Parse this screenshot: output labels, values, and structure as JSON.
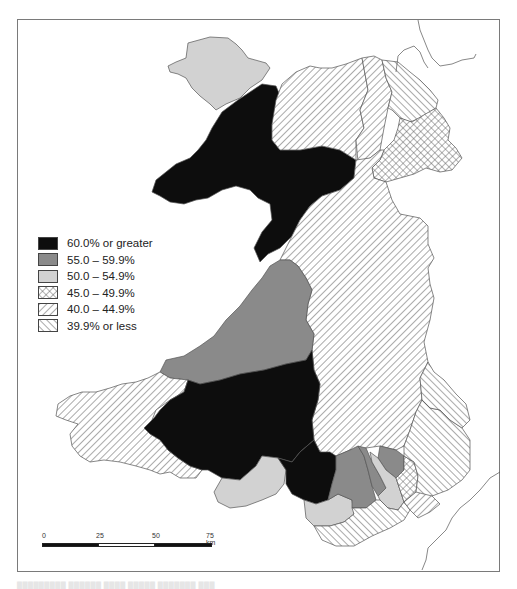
{
  "map": {
    "title": "",
    "colors": {
      "black": "#0d0d0d",
      "dark_grey": "#8a8a8a",
      "light_grey": "#d2d2d2",
      "line": "#555555",
      "frame": "#7a7a7a"
    }
  },
  "legend": {
    "items": [
      {
        "label": "60.0% or greater",
        "fill": "solid-black"
      },
      {
        "label": "55.0 – 59.9%",
        "fill": "solid-dark-grey"
      },
      {
        "label": "50.0 – 54.9%",
        "fill": "solid-light-grey"
      },
      {
        "label": "45.0 – 49.9%",
        "fill": "cross-hatch"
      },
      {
        "label": "40.0 – 44.9%",
        "fill": "forward-diagonal-hatch"
      },
      {
        "label": "39.9% or less",
        "fill": "backward-diagonal-hatch"
      }
    ]
  },
  "scale_bar": {
    "ticks": [
      "0",
      "25",
      "50",
      "75 km"
    ]
  },
  "caption": {
    "text": "█████████ ██████ ████ █████ ███████ ███"
  }
}
